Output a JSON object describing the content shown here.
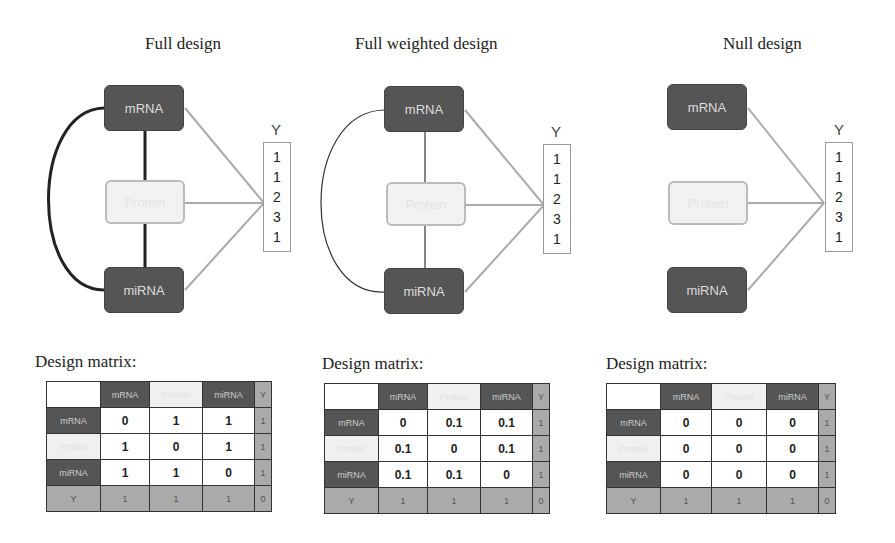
{
  "panels": [
    {
      "title": "Full design",
      "nodes": {
        "top": "mRNA",
        "middle": "Protein",
        "bottom": "miRNA"
      },
      "y_label": "Y",
      "y_values": [
        "1",
        "1",
        "2",
        "3",
        "1"
      ],
      "edges": "full (thick black)",
      "matrix_label": "Design matrix:",
      "matrix": {
        "columns": [
          "",
          "mRNA",
          "Protein",
          "miRNA",
          "Y"
        ],
        "rows": [
          {
            "label": "mRNA",
            "values": [
              "0",
              "1",
              "1"
            ],
            "y": "1"
          },
          {
            "label": "Protein",
            "values": [
              "1",
              "0",
              "1"
            ],
            "y": "1"
          },
          {
            "label": "miRNA",
            "values": [
              "1",
              "1",
              "0"
            ],
            "y": "1"
          },
          {
            "label": "Y",
            "values": [
              "1",
              "1",
              "1"
            ],
            "y": "0"
          }
        ]
      }
    },
    {
      "title": "Full weighted design",
      "nodes": {
        "top": "mRNA",
        "middle": "Protein",
        "bottom": "miRNA"
      },
      "y_label": "Y",
      "y_values": [
        "1",
        "1",
        "2",
        "3",
        "1"
      ],
      "edges": "full (thin black)",
      "matrix_label": "Design matrix:",
      "matrix": {
        "columns": [
          "",
          "mRNA",
          "Protein",
          "miRNA",
          "Y"
        ],
        "rows": [
          {
            "label": "mRNA",
            "values": [
              "0",
              "0.1",
              "0.1"
            ],
            "y": "1"
          },
          {
            "label": "Protein",
            "values": [
              "0.1",
              "0",
              "0.1"
            ],
            "y": "1"
          },
          {
            "label": "miRNA",
            "values": [
              "0.1",
              "0.1",
              "0"
            ],
            "y": "1"
          },
          {
            "label": "Y",
            "values": [
              "1",
              "1",
              "1"
            ],
            "y": "0"
          }
        ]
      }
    },
    {
      "title": "Null design",
      "nodes": {
        "top": "mRNA",
        "middle": "Protein",
        "bottom": "miRNA"
      },
      "y_label": "Y",
      "y_values": [
        "1",
        "1",
        "2",
        "3",
        "1"
      ],
      "edges": "none",
      "matrix_label": "Design matrix:",
      "matrix": {
        "columns": [
          "",
          "mRNA",
          "Protein",
          "miRNA",
          "Y"
        ],
        "rows": [
          {
            "label": "mRNA",
            "values": [
              "0",
              "0",
              "0"
            ],
            "y": "1"
          },
          {
            "label": "Protein",
            "values": [
              "0",
              "0",
              "0"
            ],
            "y": "1"
          },
          {
            "label": "miRNA",
            "values": [
              "0",
              "0",
              "0"
            ],
            "y": "1"
          },
          {
            "label": "Y",
            "values": [
              "1",
              "1",
              "1"
            ],
            "y": "0"
          }
        ]
      }
    }
  ],
  "colors": {
    "dark_node": "#555555",
    "light_node": "#f2f2f2",
    "y_cell": "#aaaaaa",
    "link_to_y": "#aaaaaa",
    "block_link": "#222222"
  }
}
